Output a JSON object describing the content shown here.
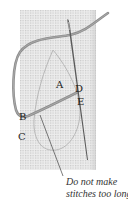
{
  "diagram": {
    "labels": {
      "a": "A",
      "b": "B",
      "c": "C",
      "d": "D",
      "e": "E"
    },
    "caption": {
      "line1": "Do not make",
      "line2": "stitches too long"
    },
    "colors": {
      "canvas": "#e9e9e9",
      "grid": "#c8c8c8",
      "thread": "#8a8a8a",
      "needle": "#555555",
      "outline": "#b5b5b5",
      "leader": "#444444"
    }
  }
}
